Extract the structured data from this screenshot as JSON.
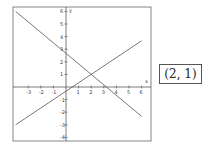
{
  "graph": {
    "axis_labels": {
      "x": "x",
      "y": "y"
    },
    "x_ticks": [
      "-3",
      "-2",
      "-1",
      "1",
      "2",
      "3",
      "4",
      "5",
      "6"
    ],
    "y_ticks": [
      "6",
      "5",
      "4",
      "3",
      "2",
      "1",
      "-1",
      "-2",
      "-3",
      "-4"
    ],
    "line_color": "#555555"
  },
  "chart_data": {
    "type": "line",
    "title": "",
    "xlabel": "x",
    "ylabel": "y",
    "xlim": [
      -4,
      6.5
    ],
    "ylim": [
      -4.5,
      6.2
    ],
    "grid": false,
    "series": [
      {
        "name": "rising line",
        "x": [
          -4,
          6
        ],
        "y": [
          -3,
          3.67
        ]
      },
      {
        "name": "falling line",
        "x": [
          -4,
          6
        ],
        "y": [
          6,
          -2.33
        ]
      }
    ],
    "annotations": [
      "intersection at (2, 1)"
    ]
  },
  "answer": {
    "text": "(2, 1)"
  }
}
